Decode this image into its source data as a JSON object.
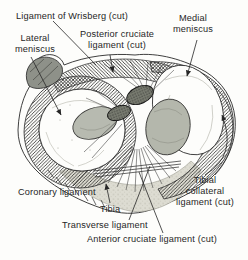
{
  "figure": {
    "colors": {
      "ink": "#262626",
      "paper": "#fdfdfb",
      "stump_gray": "#b7bab0",
      "knot_gray": "#787b70",
      "bone_stipple": "#dddcd2",
      "blob_gray": "#8e9189"
    },
    "labels": {
      "wrisberg": "Ligament of Wrisberg (cut)",
      "lateral_meniscus": [
        "Lateral",
        "meniscus"
      ],
      "posterior_cruciate": [
        "Posterior cruciate",
        "ligament (cut)"
      ],
      "medial_meniscus": [
        "Medial",
        "meniscus"
      ],
      "coronary": "Coronary ligament",
      "tibia": "Tibia",
      "transverse": "Transverse ligament",
      "anterior_cruciate": "Anterior cruciate ligament (cut)",
      "tibial_collateral": [
        "Tibial",
        "collateral",
        "ligament (cut)"
      ]
    }
  }
}
